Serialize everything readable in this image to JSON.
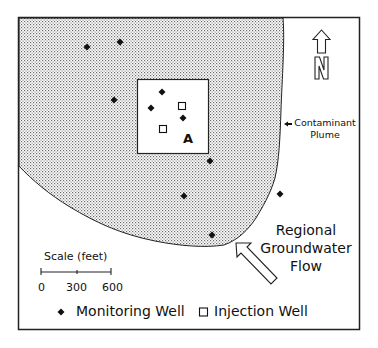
{
  "figure": {
    "type": "site map",
    "colors": {
      "frame": "#222222",
      "plume_dot": "#6a6a6a",
      "background": "#ffffff",
      "well": "#111111"
    }
  },
  "north_arrow": {
    "label": "N"
  },
  "plume": {
    "label_line1": "Contaminant",
    "label_line2": "Plume"
  },
  "site": {
    "label": "A"
  },
  "flow": {
    "line1": "Regional",
    "line2": "Groundwater",
    "line3": "Flow"
  },
  "scale": {
    "title": "Scale (feet)",
    "ticks": [
      "0",
      "300",
      "600"
    ]
  },
  "legend": {
    "monitoring_label": "Monitoring Well",
    "injection_label": "Injection Well"
  },
  "wells": {
    "monitoring": [
      {
        "x": 87,
        "y": 47
      },
      {
        "x": 120,
        "y": 42
      },
      {
        "x": 114,
        "y": 100
      },
      {
        "x": 162,
        "y": 92
      },
      {
        "x": 151,
        "y": 108
      },
      {
        "x": 183,
        "y": 118
      },
      {
        "x": 210,
        "y": 161
      },
      {
        "x": 184,
        "y": 196
      },
      {
        "x": 280,
        "y": 194
      },
      {
        "x": 212,
        "y": 235
      }
    ],
    "injection": [
      {
        "x": 182,
        "y": 106
      },
      {
        "x": 163,
        "y": 129
      }
    ]
  }
}
